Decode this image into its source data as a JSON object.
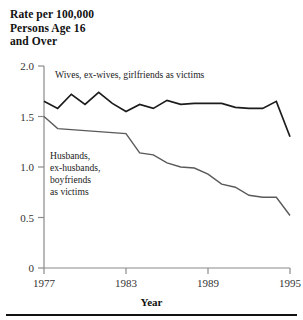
{
  "figure": {
    "y_axis_title": "Rate per 100,000\nPersons Age 16\nand Over",
    "x_axis_title": "Year"
  },
  "chart_data": {
    "type": "line",
    "title": "Rate per 100,000 Persons Age 16 and Over",
    "xlabel": "Year",
    "ylabel": "Rate per 100,000 Persons Age 16 and Over",
    "xlim": [
      1977,
      1995
    ],
    "ylim": [
      0,
      2.0
    ],
    "xticks": [
      1977,
      1983,
      1989,
      1995
    ],
    "xtick_labels": [
      "1977",
      "1983",
      "1989",
      "1995"
    ],
    "yticks": [
      0,
      0.5,
      1.0,
      1.5,
      2.0
    ],
    "ytick_labels": [
      "0",
      "0.5",
      "1.0",
      "1.5",
      "2.0"
    ],
    "grid": false,
    "legend": "inline-annotations",
    "x": [
      1977,
      1978,
      1979,
      1980,
      1981,
      1982,
      1983,
      1984,
      1985,
      1986,
      1987,
      1988,
      1989,
      1990,
      1991,
      1992,
      1993,
      1994,
      1995
    ],
    "series": [
      {
        "name": "Wives, ex-wives, girlfriends as victims",
        "label_line1": "Wives, ex-wives, girlfriends as victims",
        "color": "#1c1c1c",
        "values": [
          1.65,
          1.58,
          1.72,
          1.62,
          1.74,
          1.63,
          1.55,
          1.62,
          1.58,
          1.66,
          1.62,
          1.63,
          1.63,
          1.63,
          1.59,
          1.58,
          1.58,
          1.65,
          1.3
        ]
      },
      {
        "name": "Husbands, ex-husbands, boyfriends as victims",
        "label_line1": "Husbands,",
        "label_line2": "ex-husbands,",
        "label_line3": "boyfriends",
        "label_line4": "as victims",
        "color": "#5a5a5a",
        "values": [
          1.5,
          1.38,
          1.37,
          1.36,
          1.35,
          1.34,
          1.33,
          1.14,
          1.12,
          1.04,
          1.0,
          0.99,
          0.93,
          0.83,
          0.8,
          0.72,
          0.7,
          0.7,
          0.52
        ]
      }
    ]
  },
  "labels": {
    "upper_series": "Wives, ex-wives, girlfriends as victims",
    "lower_series_lines": [
      "Husbands,",
      "ex-husbands,",
      "boyfriends",
      "as victims"
    ],
    "y_ticks": [
      "2.0",
      "1.5",
      "1.0",
      "0.5",
      "0"
    ],
    "x_ticks": [
      "1977",
      "1983",
      "1989",
      "1995"
    ]
  },
  "colors": {
    "upper_line": "#1c1c1c",
    "lower_line": "#5a5a5a",
    "axis": "#8a8a8a",
    "text": "#1a1a1a"
  }
}
